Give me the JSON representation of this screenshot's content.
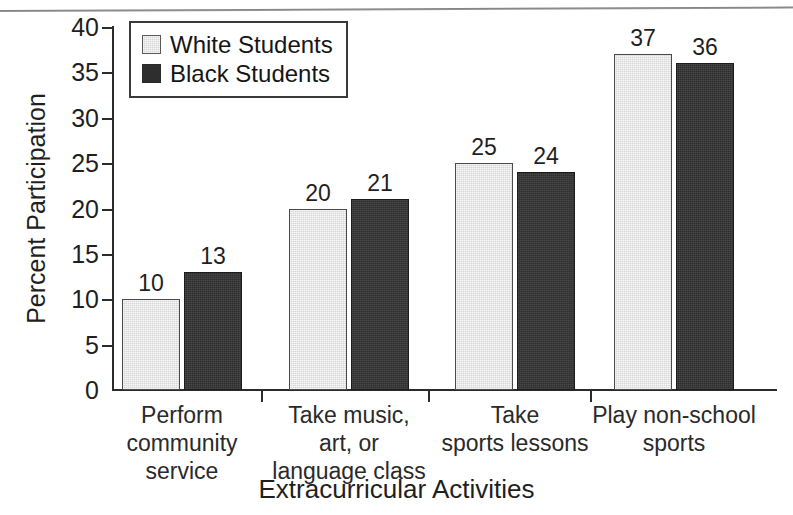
{
  "chart_data": {
    "type": "bar",
    "title": "",
    "xlabel": "Extracurricular Activities",
    "ylabel": "Percent Participation",
    "categories": [
      "Perform\ncommunity\nservice",
      "Take music,\nart, or\nlanguage class",
      "Take\nsports lessons",
      "Play non-school\nsports"
    ],
    "series": [
      {
        "name": "White Students",
        "color": "#d6d6d6",
        "values": [
          10,
          20,
          25,
          37
        ]
      },
      {
        "name": "Black Students",
        "color": "#2e2e2e",
        "values": [
          13,
          21,
          24,
          36
        ]
      }
    ],
    "ylim": [
      0,
      40
    ],
    "yticks": [
      0,
      5,
      10,
      15,
      20,
      25,
      30,
      35,
      40
    ],
    "ytick_labels": [
      "0",
      "5",
      "10",
      "15",
      "20",
      "25",
      "30",
      "35",
      "40"
    ],
    "grid": false,
    "legend_position": "top-left",
    "value_labels": [
      [
        "10",
        "13"
      ],
      [
        "20",
        "21"
      ],
      [
        "25",
        "24"
      ],
      [
        "37",
        "36"
      ]
    ]
  },
  "legend": {
    "items": [
      {
        "label": "White Students",
        "swatch": "white-students-swatch"
      },
      {
        "label": "Black Students",
        "swatch": "black-students-swatch"
      }
    ]
  },
  "axes": {
    "y_title": "Percent Participation",
    "x_title": "Extracurricular Activities",
    "y_labels": [
      "40",
      "35",
      "30",
      "25",
      "20",
      "15",
      "10",
      "5",
      "0"
    ]
  },
  "categories": [
    {
      "lines": [
        "Perform",
        "community",
        "service"
      ]
    },
    {
      "lines": [
        "Take music,",
        "art, or",
        "language class"
      ]
    },
    {
      "lines": [
        "Take",
        "sports lessons"
      ]
    },
    {
      "lines": [
        "Play non-school",
        "sports"
      ]
    }
  ]
}
